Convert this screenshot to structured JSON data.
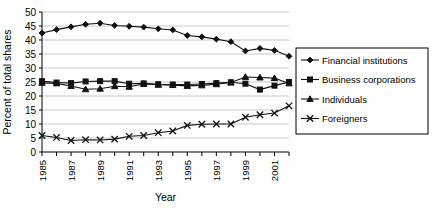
{
  "chart_data": {
    "type": "line",
    "title": "",
    "xlabel": "Year",
    "ylabel": "Percent of total shares",
    "xlim": [
      1985,
      2002
    ],
    "ylim": [
      0,
      50
    ],
    "ytick_step": 5,
    "yticks": [
      0,
      5,
      10,
      15,
      20,
      25,
      30,
      35,
      40,
      45,
      50
    ],
    "xticks": [
      1985,
      1986,
      1987,
      1988,
      1989,
      1990,
      1991,
      1992,
      1993,
      1994,
      1995,
      1996,
      1997,
      1998,
      1999,
      2000,
      2001,
      2002
    ],
    "xtick_labels": [
      "1985",
      "",
      "1987",
      "",
      "1989",
      "",
      "1991",
      "",
      "1993",
      "",
      "1995",
      "",
      "1997",
      "",
      "1999",
      "",
      "2001",
      ""
    ],
    "xtick_label_rotation": -90,
    "grid": "horizontal",
    "legend_position": "right",
    "x": [
      1985,
      1986,
      1987,
      1988,
      1989,
      1990,
      1991,
      1992,
      1993,
      1994,
      1995,
      1996,
      1997,
      1998,
      1999,
      2000,
      2001,
      2002
    ],
    "series": [
      {
        "name": "Financial institutions",
        "marker": "diamond",
        "values": [
          42.5,
          43.7,
          44.7,
          45.6,
          46.0,
          45.2,
          44.9,
          44.6,
          44.0,
          43.6,
          41.6,
          41.1,
          40.3,
          39.4,
          36.1,
          37.0,
          36.3,
          34.2
        ]
      },
      {
        "name": "Business corporations",
        "marker": "square",
        "values": [
          25.3,
          24.8,
          24.6,
          25.2,
          25.3,
          25.3,
          24.4,
          24.5,
          24.2,
          24.1,
          24.1,
          24.3,
          24.6,
          24.9,
          24.4,
          22.3,
          23.7,
          25.0
        ]
      },
      {
        "name": "Individuals",
        "marker": "triangle",
        "values": [
          24.7,
          24.5,
          23.6,
          22.4,
          22.6,
          23.5,
          23.3,
          24.3,
          24.0,
          23.9,
          23.6,
          23.8,
          24.2,
          24.8,
          26.8,
          26.6,
          26.4,
          24.5
        ]
      },
      {
        "name": "Foreigners",
        "marker": "x",
        "values": [
          5.9,
          5.2,
          4.1,
          4.4,
          4.3,
          4.6,
          5.6,
          5.9,
          6.9,
          7.5,
          9.5,
          9.9,
          10.0,
          10.0,
          12.4,
          13.3,
          13.9,
          16.5
        ]
      }
    ]
  },
  "legend": {
    "items": [
      {
        "label": "Financial institutions",
        "marker": "diamond"
      },
      {
        "label": "Business corporations",
        "marker": "square"
      },
      {
        "label": "Individuals",
        "marker": "triangle"
      },
      {
        "label": "Foreigners",
        "marker": "x"
      }
    ]
  }
}
